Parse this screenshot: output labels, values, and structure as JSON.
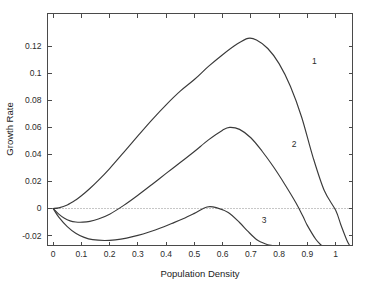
{
  "chart_data": {
    "type": "line",
    "title": "",
    "xlabel": "Population Density",
    "ylabel": "Growth Rate",
    "xlim": [
      -0.02,
      1.06
    ],
    "ylim": [
      -0.0274,
      0.1444
    ],
    "grid": false,
    "legend": "inline-curve-labels",
    "xticks": [
      0,
      0.1,
      0.2,
      0.3,
      0.4,
      0.5,
      0.6,
      0.7,
      0.8,
      0.9,
      1
    ],
    "xticklabels": [
      "0",
      "0.1",
      "0.2",
      "0.3",
      "0.4",
      "0.5",
      "0.6",
      "0.7",
      "0.8",
      "0.9",
      "1"
    ],
    "yticks": [
      -0.02,
      0,
      0.02,
      0.04,
      0.06,
      0.08,
      0.1,
      0.12
    ],
    "yticklabels": [
      "-0.02",
      "0",
      "0.02",
      "0.04",
      "0.06",
      "0.08",
      "0.1",
      "0.12"
    ],
    "reference_lines": [
      {
        "name": "zero-growth-line",
        "axis": "y",
        "value": 0,
        "style": "dotted"
      }
    ],
    "annotations": [
      {
        "text": "1",
        "x": 0.925,
        "y": 0.1095
      },
      {
        "text": "2",
        "x": 0.853,
        "y": 0.0475
      },
      {
        "text": "3",
        "x": 0.747,
        "y": -0.0085
      }
    ],
    "series": [
      {
        "name": "1",
        "label": "1",
        "peak": {
          "x": 0.69,
          "y": 0.126
        },
        "zero_crossing": 1.02,
        "x": [
          0,
          0.02,
          0.05,
          0.08,
          0.1,
          0.13,
          0.16,
          0.2,
          0.25,
          0.3,
          0.35,
          0.4,
          0.45,
          0.5,
          0.55,
          0.6,
          0.65,
          0.69,
          0.72,
          0.76,
          0.8,
          0.84,
          0.88,
          0.92,
          0.96,
          1.0,
          1.02,
          1.04,
          1.05
        ],
        "y": [
          0,
          0.0005,
          0.0026,
          0.0063,
          0.0094,
          0.0148,
          0.0208,
          0.0296,
          0.0416,
          0.0538,
          0.0657,
          0.0768,
          0.0869,
          0.0955,
          0.1052,
          0.1139,
          0.1216,
          0.126,
          0.1248,
          0.1185,
          0.1073,
          0.0905,
          0.0676,
          0.0381,
          0.0133,
          -0.0012,
          -0.0128,
          -0.0235,
          -0.0274
        ]
      },
      {
        "name": "2",
        "label": "2",
        "trough": {
          "x": 0.105,
          "y": -0.0101
        },
        "peak": {
          "x": 0.625,
          "y": 0.0601
        },
        "zero_crossing": 0.885,
        "x": [
          0,
          0.02,
          0.04,
          0.06,
          0.08,
          0.105,
          0.13,
          0.16,
          0.2,
          0.25,
          0.3,
          0.35,
          0.4,
          0.45,
          0.5,
          0.55,
          0.6,
          0.625,
          0.66,
          0.7,
          0.74,
          0.78,
          0.82,
          0.86,
          0.885,
          0.9,
          0.93,
          0.95
        ],
        "y": [
          0,
          -0.0042,
          -0.0073,
          -0.0092,
          -0.01,
          -0.0101,
          -0.0095,
          -0.0078,
          -0.0042,
          0.0023,
          0.0098,
          0.0178,
          0.026,
          0.034,
          0.0422,
          0.0508,
          0.058,
          0.0601,
          0.0586,
          0.0524,
          0.0424,
          0.0309,
          0.018,
          0.0041,
          -0.006,
          -0.0125,
          -0.0228,
          -0.0274
        ]
      },
      {
        "name": "3",
        "label": "3",
        "trough": {
          "x": 0.182,
          "y": -0.0237
        },
        "peak": {
          "x": 0.545,
          "y": 0.0011
        },
        "zero_crossing": 0.72,
        "x": [
          0,
          0.02,
          0.05,
          0.08,
          0.11,
          0.14,
          0.182,
          0.22,
          0.26,
          0.3,
          0.34,
          0.38,
          0.42,
          0.46,
          0.5,
          0.545,
          0.58,
          0.62,
          0.66,
          0.69,
          0.72,
          0.74,
          0.76,
          0.775
        ],
        "y": [
          0,
          -0.0064,
          -0.0134,
          -0.0183,
          -0.0214,
          -0.0231,
          -0.0237,
          -0.0232,
          -0.0219,
          -0.0199,
          -0.0174,
          -0.0145,
          -0.0111,
          -0.0076,
          -0.0036,
          0.0011,
          0.0005,
          -0.003,
          -0.0104,
          -0.017,
          -0.023,
          -0.0252,
          -0.0268,
          -0.0274
        ]
      }
    ]
  }
}
